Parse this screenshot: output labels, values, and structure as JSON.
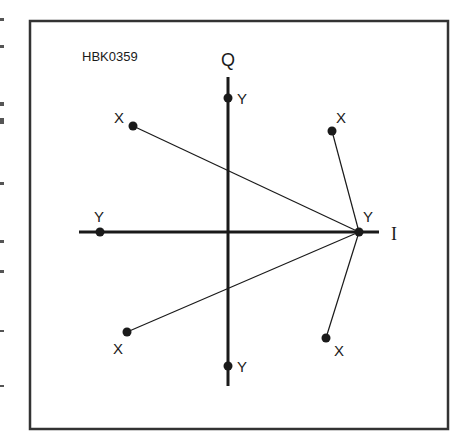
{
  "diagram": {
    "id_label": "HBK0359",
    "axes": {
      "q_label": "Q",
      "i_label": "I"
    },
    "y_points": [
      {
        "name": "y-top",
        "label": "Y",
        "q": 1,
        "i": 0
      },
      {
        "name": "y-left",
        "label": "Y",
        "q": 0,
        "i": -1
      },
      {
        "name": "y-right",
        "label": "Y",
        "q": 0,
        "i": 1
      },
      {
        "name": "y-bottom",
        "label": "Y",
        "q": -1,
        "i": 0
      }
    ],
    "x_points": [
      {
        "name": "x-upper-left",
        "label": "X"
      },
      {
        "name": "x-upper-right",
        "label": "X"
      },
      {
        "name": "x-lower-left",
        "label": "X"
      },
      {
        "name": "x-lower-right",
        "label": "X"
      }
    ],
    "connections": [
      {
        "from": "x-upper-left",
        "to": "y-right"
      },
      {
        "from": "x-upper-right",
        "to": "y-right"
      },
      {
        "from": "x-lower-left",
        "to": "y-right"
      },
      {
        "from": "x-lower-right",
        "to": "y-right"
      }
    ],
    "colors": {
      "ink": "#1a1a1a",
      "frame": "#333333",
      "background": "#ffffff"
    }
  }
}
